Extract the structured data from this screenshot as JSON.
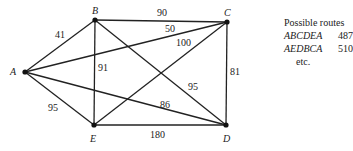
{
  "graph": {
    "nodes": [
      {
        "id": "A",
        "label": "A",
        "x": 25,
        "y": 72
      },
      {
        "id": "B",
        "label": "B",
        "x": 95,
        "y": 20
      },
      {
        "id": "C",
        "label": "C",
        "x": 227,
        "y": 22
      },
      {
        "id": "D",
        "label": "D",
        "x": 226,
        "y": 125
      },
      {
        "id": "E",
        "label": "E",
        "x": 94,
        "y": 125
      }
    ],
    "edges": [
      {
        "from": "A",
        "to": "B",
        "weight": "41"
      },
      {
        "from": "A",
        "to": "C",
        "weight": "50"
      },
      {
        "from": "A",
        "to": "D",
        "weight": "86"
      },
      {
        "from": "A",
        "to": "E",
        "weight": "95"
      },
      {
        "from": "B",
        "to": "C",
        "weight": "90"
      },
      {
        "from": "B",
        "to": "D",
        "weight": "95"
      },
      {
        "from": "B",
        "to": "E",
        "weight": "91"
      },
      {
        "from": "C",
        "to": "D",
        "weight": "81"
      },
      {
        "from": "C",
        "to": "E",
        "weight": "100"
      },
      {
        "from": "D",
        "to": "E",
        "weight": "180"
      }
    ]
  },
  "legend": {
    "title": "Possible routes",
    "routes": [
      {
        "route": "ABCDEA",
        "length": "487"
      },
      {
        "route": "AEDBCA",
        "length": "510"
      }
    ],
    "more": "etc."
  }
}
